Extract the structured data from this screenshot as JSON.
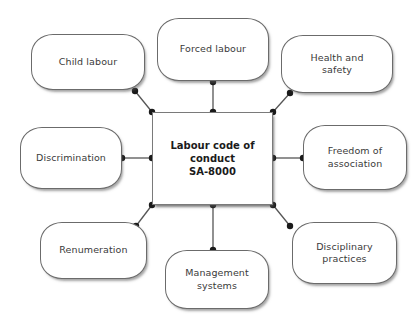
{
  "diagram": {
    "type": "hub-and-spoke",
    "background_color": "#ffffff",
    "node_border_color": "#6b6b6b",
    "edge_color": "#555555",
    "center": {
      "label_lines": [
        "Labour code of",
        "conduct",
        "SA-8000"
      ],
      "label": "Labour code of conduct SA-8000"
    },
    "nodes": [
      {
        "id": "child-labour",
        "label": "Child labour",
        "lines": [
          "Child labour"
        ],
        "position": "top-left"
      },
      {
        "id": "forced-labour",
        "label": "Forced labour",
        "lines": [
          "Forced labour"
        ],
        "position": "top"
      },
      {
        "id": "health-safety",
        "label": "Health and safety",
        "lines": [
          "Health and",
          "safety"
        ],
        "position": "top-right"
      },
      {
        "id": "discrimination",
        "label": "Discrimination",
        "lines": [
          "Discrimination"
        ],
        "position": "left"
      },
      {
        "id": "freedom",
        "label": "Freedom of association",
        "lines": [
          "Freedom of",
          "association"
        ],
        "position": "right"
      },
      {
        "id": "renumeration",
        "label": "Renumeration",
        "lines": [
          "Renumeration"
        ],
        "position": "bottom-left"
      },
      {
        "id": "management",
        "label": "Management systems",
        "lines": [
          "Management",
          "systems"
        ],
        "position": "bottom"
      },
      {
        "id": "disciplinary",
        "label": "Disciplinary practices",
        "lines": [
          "Disciplinary",
          "practices"
        ],
        "position": "bottom-right"
      }
    ]
  }
}
